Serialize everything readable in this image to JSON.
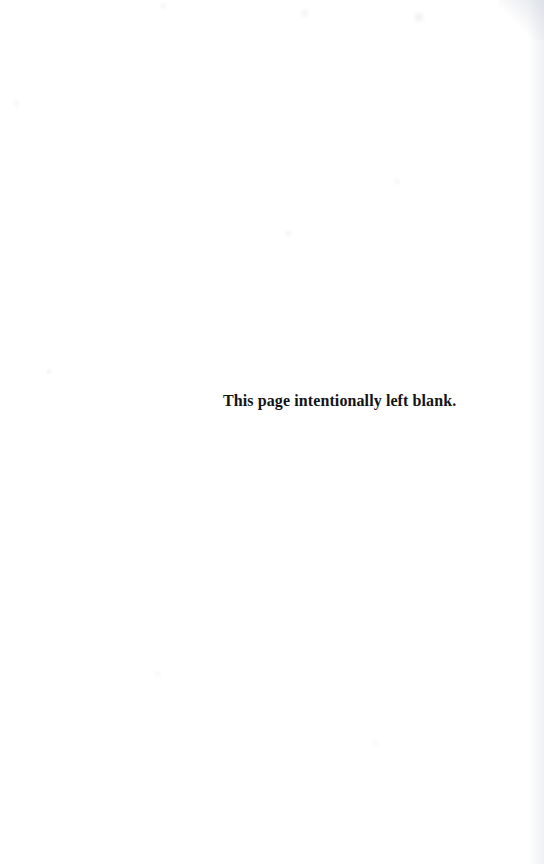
{
  "page": {
    "kind": "scanned-book-page",
    "background_color": "#ffffff",
    "text_color": "#141414",
    "width": 544,
    "height": 864
  },
  "content": {
    "notice": "This page intentionally left blank."
  },
  "artifacts": {
    "speckles_visible": "true",
    "right_edge_shading": "true",
    "top_right_corner_shadow": "true"
  }
}
